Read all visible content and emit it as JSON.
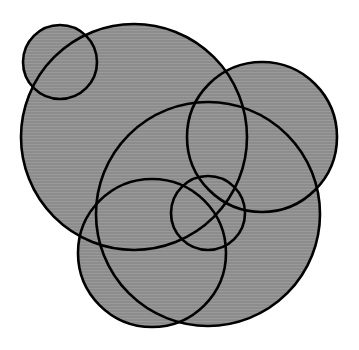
{
  "diagram": {
    "type": "overlapping-circles",
    "width": 359,
    "height": 350,
    "background": "#ffffff",
    "fill_color": "#8c8c8c",
    "stripe_color": "#9a9a9a",
    "stroke_color": "#000000",
    "stroke_width": 2.6,
    "circles": [
      {
        "id": "circle-small-top-left",
        "cx": 60,
        "cy": 62,
        "r": 37
      },
      {
        "id": "circle-large-top-left",
        "cx": 134,
        "cy": 137,
        "r": 113
      },
      {
        "id": "circle-right",
        "cx": 262,
        "cy": 137,
        "r": 75
      },
      {
        "id": "circle-large-center",
        "cx": 208,
        "cy": 214,
        "r": 112
      },
      {
        "id": "circle-lower-left",
        "cx": 152,
        "cy": 253,
        "r": 74
      },
      {
        "id": "circle-small-center",
        "cx": 208,
        "cy": 213,
        "r": 37
      }
    ]
  }
}
